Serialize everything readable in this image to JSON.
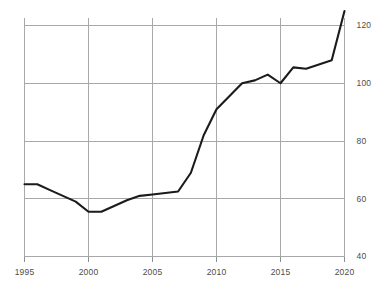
{
  "chart_data": {
    "type": "line",
    "title": "",
    "subtitle": "",
    "xlabel": "",
    "ylabel": "",
    "xlim": [
      1995,
      2020
    ],
    "ylim": [
      40,
      125
    ],
    "grid": true,
    "legend": null,
    "x_ticks": [
      1995,
      2000,
      2005,
      2010,
      2015,
      2020
    ],
    "y_ticks": [
      40,
      60,
      80,
      100,
      120
    ],
    "y_tick_labels": [
      "40",
      "60",
      "80",
      "100",
      "120"
    ],
    "x_tick_labels": [
      "1995",
      "2000",
      "2005",
      "2010",
      "2015",
      "2020"
    ],
    "x": [
      1995,
      1996,
      1997,
      1998,
      1999,
      2000,
      2001,
      2002,
      2003,
      2004,
      2005,
      2006,
      2007,
      2008,
      2009,
      2010,
      2011,
      2012,
      2013,
      2014,
      2015,
      2016,
      2017,
      2018,
      2019,
      2020
    ],
    "values": [
      65,
      65,
      63,
      61,
      59,
      55.5,
      55.5,
      57.5,
      59.5,
      61,
      61.5,
      62,
      62.5,
      69,
      82,
      91,
      95.5,
      100,
      101,
      103,
      100,
      105.5,
      105,
      106.5,
      108,
      125
    ],
    "series": [
      {
        "name": "index",
        "color": "#1b1b1b",
        "values": [
          65,
          65,
          63,
          61,
          59,
          55.5,
          55.5,
          57.5,
          59.5,
          61,
          61.5,
          62,
          62.5,
          69,
          82,
          91,
          95.5,
          100,
          101,
          103,
          100,
          105.5,
          105,
          106.5,
          108,
          125
        ]
      }
    ],
    "colors": {
      "line": "#1b1b1b",
      "grid": "#a8a8a8",
      "text": "#4d4d4d",
      "background": "#ffffff"
    }
  }
}
